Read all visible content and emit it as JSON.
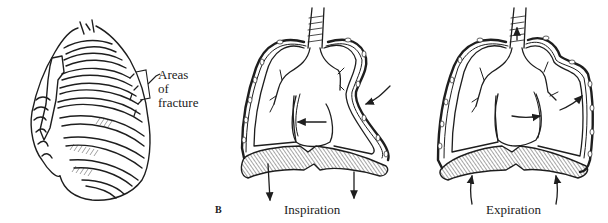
{
  "figure": {
    "panel_a": {
      "subject": "rib-cage",
      "callout": {
        "line1": "Areas of",
        "line2": "fracture"
      }
    },
    "figure_letter": "B",
    "panel_inspiration": {
      "caption": "Inspiration",
      "arrows": [
        "chest-wall-inward",
        "mediastinum-shift-left",
        "diaphragm-down-left",
        "diaphragm-down-right"
      ]
    },
    "panel_expiration": {
      "caption": "Expiration",
      "arrows": [
        "chest-wall-outward",
        "mediastinum-shift-right",
        "diaphragm-up-left",
        "diaphragm-up-right"
      ]
    }
  },
  "colors": {
    "ink": "#1e1e1e",
    "background": "#ffffff"
  }
}
